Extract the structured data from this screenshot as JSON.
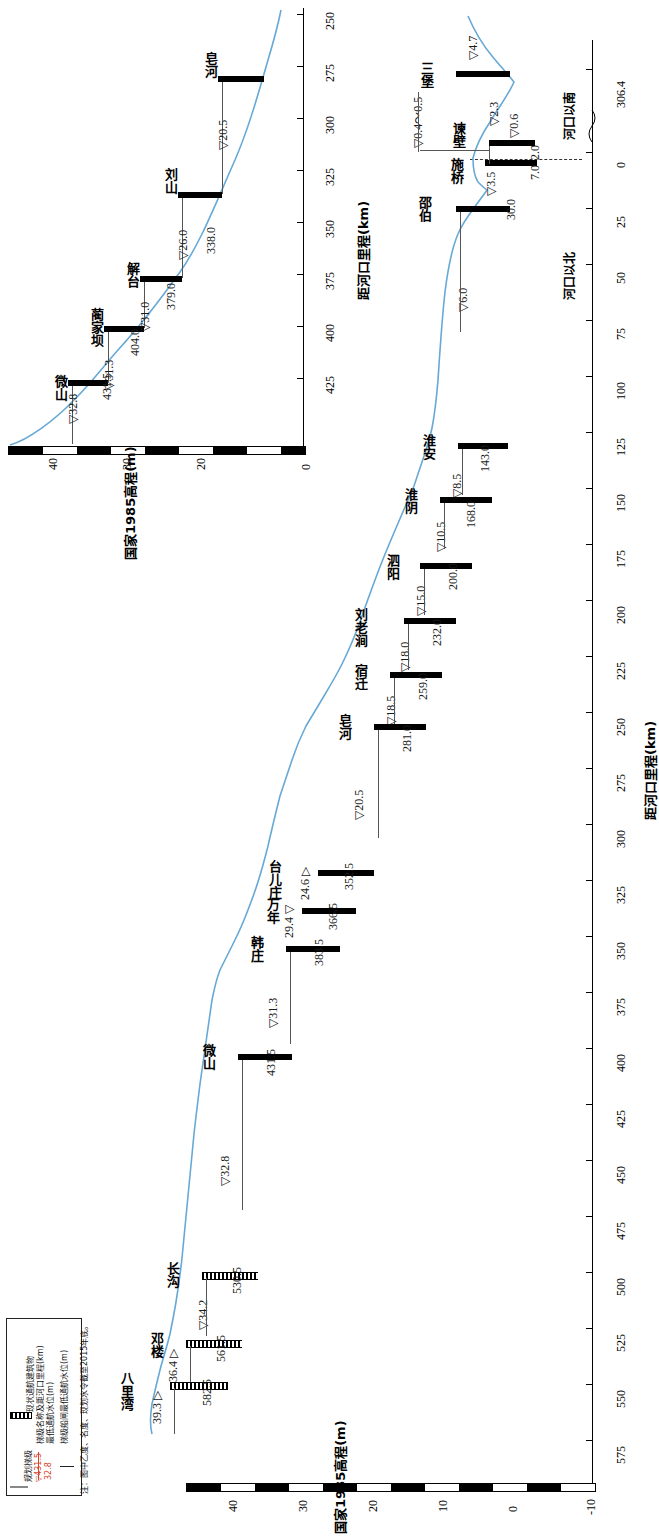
{
  "figure": {
    "kind": "longitudinal-profile",
    "orientation": "rotated-90",
    "y_axis_title": "国家1985高程(m)",
    "x_axis_title": "距河口里程(km)",
    "section_north_label": "河口以北",
    "section_south_label": "河口以南"
  },
  "upper_panel": {
    "y_axis_title": "国家1985高程(m)",
    "x_axis_title": "距河口里程(km)",
    "y_ticks": [
      "40",
      "30",
      "20",
      "0"
    ],
    "x_ticks": [
      "425",
      "400",
      "375",
      "350",
      "325",
      "300",
      "275",
      "250"
    ],
    "stations": [
      {
        "name": "微山",
        "km": "431.5",
        "wl": "▽32.8"
      },
      {
        "name": "蔺家坝",
        "km": "404.0",
        "wl": "▽31.3"
      },
      {
        "name": "解台",
        "km": "379.0",
        "wl": "▽31.0"
      },
      {
        "name": "刘山",
        "km": "338.0",
        "wl": "▽26.0"
      },
      {
        "name": "皂河",
        "km": "",
        "wl": "▽20.5"
      }
    ]
  },
  "lower_panel": {
    "y_axis_title": "国家1985高程(m)",
    "x_axis_title": "距河口里程(km)",
    "y_ticks": [
      "40",
      "30",
      "20",
      "10",
      "0",
      "-10"
    ],
    "x_ticks": [
      "625",
      "600",
      "575",
      "550",
      "525",
      "500",
      "475",
      "450",
      "425",
      "400",
      "375",
      "350",
      "325",
      "300",
      "275",
      "250",
      "225",
      "200",
      "175",
      "150",
      "125",
      "100",
      "75",
      "50",
      "25",
      "0"
    ],
    "x_tick_end": "306.4",
    "stations": [
      {
        "name": "八里湾",
        "km": "582.5",
        "wl": "39.3 ▷"
      },
      {
        "name": "邓楼",
        "km": "561.5",
        "wl": "36.4 ▷"
      },
      {
        "name": "长沟",
        "km": "530.5",
        "wl": "▽34.2"
      },
      {
        "name": "微山",
        "km": "431.5",
        "wl": "▽32.8"
      },
      {
        "name": "韩庄",
        "km": "383.5",
        "wl": "▽31.3"
      },
      {
        "name": "万年",
        "km": "366.5",
        "wl": "29.4 ▽"
      },
      {
        "name": "台儿庄",
        "km": "352.5",
        "wl": "24.6 ▷"
      },
      {
        "name": "皂河",
        "km": "281.0",
        "wl": "▽20.5"
      },
      {
        "name": "宿迁",
        "km": "259.0",
        "wl": "▽18.5"
      },
      {
        "name": "刘老涧",
        "km": "232.0",
        "wl": "▽18.0"
      },
      {
        "name": "泗阳",
        "km": "200.0",
        "wl": "▽15.0"
      },
      {
        "name": "淮阴",
        "km": "168.0",
        "wl": "▽10.5"
      },
      {
        "name": "淮安",
        "km": "143.0",
        "wl": "▽8.5"
      },
      {
        "name": "邵伯",
        "km": "30.0",
        "wl": "▽6.0"
      },
      {
        "name": "施桥",
        "km": "7.0",
        "wl": "▽3.5"
      },
      {
        "name": "谏壁",
        "km": "2.0",
        "wl": "▽0.6"
      },
      {
        "name": "三堡",
        "km": "",
        "wl": "▽4.7"
      }
    ],
    "extra_labels": [
      {
        "text": "▽0.4～0.5"
      },
      {
        "text": "▽2.3"
      }
    ]
  },
  "legend": {
    "title": "",
    "items": [
      {
        "label": "规划梯级",
        "sample": "line-gray"
      },
      {
        "label": "现状通航建筑物",
        "sample": "bar-black"
      },
      {
        "label": "梯级名称及距河口里程(km)",
        "sample": "text-red"
      },
      {
        "label": "最低通航水位(m)",
        "sample": ""
      },
      {
        "label": "梯级船闸最低通航水位(m)",
        "sample": "arrow"
      },
      {
        "label": "▽431.5",
        "sample": "red-upper"
      },
      {
        "label": "32.8",
        "sample": "red-lower"
      }
    ],
    "note": "注：图中乙度、名度、现划水令截至2015年底。"
  }
}
